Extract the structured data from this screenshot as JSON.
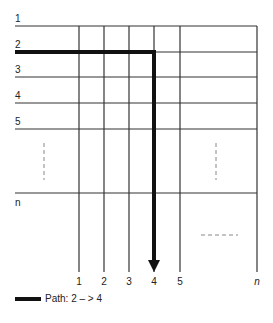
{
  "diagram": {
    "type": "grid-path",
    "rows": [
      {
        "label": "1",
        "y": 26
      },
      {
        "label": "2",
        "y": 52
      },
      {
        "label": "3",
        "y": 77
      },
      {
        "label": "4",
        "y": 103
      },
      {
        "label": "5",
        "y": 129
      },
      {
        "label": "n",
        "y": 193
      }
    ],
    "columns": [
      {
        "label": "1",
        "x": 79
      },
      {
        "label": "2",
        "x": 104
      },
      {
        "label": "3",
        "x": 129
      },
      {
        "label": "4",
        "x": 154
      },
      {
        "label": "5",
        "x": 180
      },
      {
        "label": "n",
        "x": 257
      }
    ],
    "row_ellipsis": "- - - - -",
    "col_ellipsis": "- - - - -",
    "path": {
      "from_row": "2",
      "to_column": "4",
      "color": "#111111"
    }
  },
  "legend": {
    "label": "Path: 2 – > 4"
  },
  "colors": {
    "line": "#333333",
    "path": "#111111",
    "dash": "#888888"
  }
}
